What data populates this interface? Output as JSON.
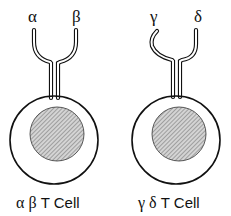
{
  "diagram": {
    "cells": [
      {
        "name": "alpha-beta-t-cell",
        "chain_left": "α",
        "chain_right": "β",
        "label_greek": "α β",
        "label_text": "T Cell"
      },
      {
        "name": "gamma-delta-t-cell",
        "chain_left": "γ",
        "chain_right": "δ",
        "label_greek": "γ δ",
        "label_text": "T Cell"
      }
    ],
    "colors": {
      "stroke": "#111111",
      "nucleus_fill": "#b8b8b8",
      "background": "#ffffff"
    }
  }
}
